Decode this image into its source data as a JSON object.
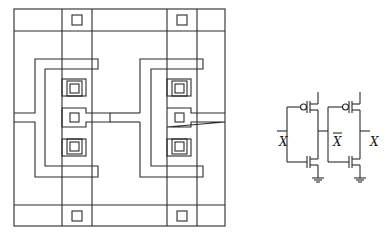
{
  "diagram": {
    "title": "",
    "layout": {
      "description": "Two-inverter CMOS chip layout with four contact pads and three stacked contacts per inverter",
      "inverters": [
        {
          "name": "inverter-1",
          "contacts": 3
        },
        {
          "name": "inverter-2",
          "contacts": 3
        }
      ],
      "pads": [
        "top-left",
        "top-right",
        "bottom-left",
        "bottom-right"
      ]
    },
    "schematic": {
      "inverters": [
        {
          "name": "inverter-1",
          "input_label": "X",
          "output_label": "X̄"
        },
        {
          "name": "inverter-2",
          "input_label": "X̄",
          "output_label": "X"
        }
      ],
      "labels": {
        "input_x": "X",
        "middle_xbar": "X",
        "output_x": "X"
      },
      "symbols": [
        "pmos-transistor",
        "nmos-transistor",
        "ground-symbol"
      ]
    },
    "colors": {
      "line": "#2a2a2a",
      "background": "#ffffff"
    }
  }
}
